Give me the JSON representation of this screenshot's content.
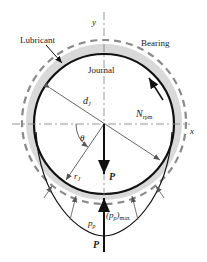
{
  "diagram": {
    "labels": {
      "lubricant": "Lubricant",
      "bearing": "Bearing",
      "journal": "Journal",
      "y_axis": "y",
      "x_axis": "x",
      "diameter": "d",
      "diameter_sub": "J",
      "speed": "N",
      "speed_sub": "rpm",
      "angle": "θ",
      "radius": "r",
      "radius_sub": "J",
      "load_top": "P",
      "load_bottom": "P",
      "pressure": "p",
      "pressure_sub": "p",
      "pressure_max_open": "(p",
      "pressure_max_sub": "p",
      "pressure_max_close": ")",
      "pressure_max_suffix": "max"
    },
    "colors": {
      "journal_outline": "#111111",
      "lubricant_fill": "#d9d9d9",
      "bearing_dashes": "#8a8a8a",
      "centerline": "#8a8a8a",
      "arrows": "#555555"
    }
  }
}
